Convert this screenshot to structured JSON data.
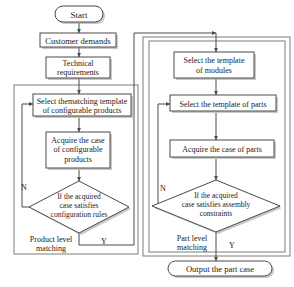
{
  "diagram": {
    "start_label": "Start",
    "end_label": "Output the part case",
    "colors": {
      "stroke": "#4a4a4a",
      "container_stroke": "#7d7d7d",
      "fill": "#ffffff",
      "shadow": "#9a9a9a",
      "text": "#1a1a1a"
    }
  },
  "left_branch": {
    "group_label_line1": "Product level",
    "group_label_line2": "matching",
    "nodes": {
      "customer_demands": "Customer demands",
      "technical_requirements_line1": "Technical",
      "technical_requirements_line2": "requirements",
      "select_template_line1": "Select thematching template",
      "select_template_line2": "of configurable products",
      "acquire_case_line1": "Acquire the case",
      "acquire_case_line2": "of configurable",
      "acquire_case_line3": "products",
      "decision_line1": "If the acquired",
      "decision_line2": "case satisfies",
      "decision_line3": "configuration rules"
    },
    "branch_no": "N",
    "branch_yes": "Y"
  },
  "right_branch": {
    "group_label_line1": "Part level",
    "group_label_line2": "matching",
    "nodes": {
      "select_modules_line1": "Select the template",
      "select_modules_line2": "of modules",
      "select_parts": "Select the template of parts",
      "acquire_parts": "Acquire the case of parts",
      "decision_line1": "If the acquired",
      "decision_line2": "case satisfies assembly",
      "decision_line3": "constraints"
    },
    "branch_no": "N",
    "branch_yes": "Y"
  }
}
